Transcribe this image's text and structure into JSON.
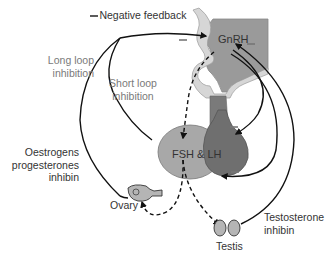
{
  "diagram": {
    "legend": {
      "symbol": "—",
      "label": "Negative feedback"
    },
    "labels": {
      "gnrh": "GnRH",
      "fsh_lh": "FSH & LH",
      "long_loop_line1": "Long loop",
      "long_loop_line2": "inhibition",
      "short_loop_line1": "Short loop",
      "short_loop_line2": "inhibition",
      "oestrogens_line1": "Oestrogens",
      "oestrogens_line2": "progesterones",
      "oestrogens_line3": "inhibin",
      "ovary": "Ovary",
      "testis": "Testis",
      "testosterone_line1": "Testosterone",
      "testosterone_line2": "inhibin"
    },
    "colors": {
      "hypothalamus": "#9a9a9a",
      "stalk_outline": "#d6d6d6",
      "anterior_pituitary": "#a8a8a8",
      "posterior_pituitary": "#6f6f6f",
      "gonad": "#b5b5b5",
      "arrow": "#111111",
      "label_grey": "#7a7a7a",
      "label_dark": "#333333"
    }
  }
}
